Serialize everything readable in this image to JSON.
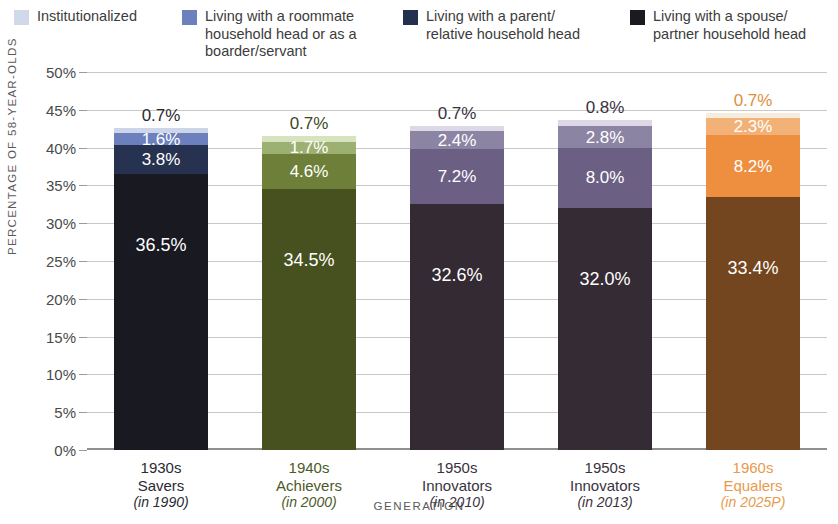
{
  "legend": {
    "items": [
      {
        "label": "Institutionalized",
        "color": "#cfd9ea",
        "name": "legend-institutionalized"
      },
      {
        "label": "Living with a roommate\nhousehold head or as a\nboarder/servant",
        "color": "#6b80bd",
        "name": "legend-roommate"
      },
      {
        "label": "Living with a parent/\nrelative household head",
        "color": "#23304f",
        "name": "legend-parent"
      },
      {
        "label": "Living with a spouse/\npartner household head",
        "color": "#1a1a20",
        "name": "legend-spouse"
      }
    ]
  },
  "chart_data": {
    "type": "bar",
    "title": "",
    "subtitle": "",
    "xlabel": "GENERATION",
    "ylabel": "PERCENTAGE OF 58-YEAR-OLDS",
    "ylim": [
      0,
      50
    ],
    "ytick_labels": [
      "0%",
      "5%",
      "10%",
      "15%",
      "20%",
      "25%",
      "30%",
      "35%",
      "40%",
      "45%",
      "50%"
    ],
    "ytick_values": [
      0,
      5,
      10,
      15,
      20,
      25,
      30,
      35,
      40,
      45,
      50
    ],
    "grid": true,
    "stacked": true,
    "legend_position": "top",
    "categories": [
      "1930s\nSavers\n(in 1990)",
      "1940s\nAchievers\n(in 2000)",
      "1950s\nInnovators\n(in 2010)",
      "1950s\nInnovators\n(in 2013)",
      "1960s\nEqualers\n(in 2025P)"
    ],
    "series": [
      {
        "name": "Living with a spouse/partner household head",
        "values": [
          36.5,
          34.5,
          32.6,
          32.0,
          33.4
        ]
      },
      {
        "name": "Living with a parent/relative household head",
        "values": [
          3.8,
          4.6,
          7.2,
          8.0,
          8.2
        ]
      },
      {
        "name": "Living with a roommate household head or as a boarder/servant",
        "values": [
          1.6,
          1.7,
          2.4,
          2.8,
          2.3
        ]
      },
      {
        "name": "Institutionalized",
        "values": [
          0.7,
          0.7,
          0.7,
          0.8,
          0.7
        ]
      }
    ],
    "bars": [
      {
        "category_line1": "1930s",
        "category_line2": "Savers",
        "category_line3": "(in 1990)",
        "label_color": "#2a2a33",
        "segments": [
          {
            "series": "Institutionalized",
            "value": 0.7,
            "label": "0.7%",
            "color": "#ccd6e8",
            "label_color": "#2a2a33",
            "label_outside": true
          },
          {
            "series": "Living with a roommate household head or as a boarder/servant",
            "value": 1.6,
            "label": "1.6%",
            "color": "#6b80bd",
            "label_color": "#ffffff",
            "label_outside": false
          },
          {
            "series": "Living with a parent/relative household head",
            "value": 3.8,
            "label": "3.8%",
            "color": "#26324f",
            "label_color": "#ffffff",
            "label_outside": false
          },
          {
            "series": "Living with a spouse/partner household head",
            "value": 36.5,
            "label": "36.5%",
            "color": "#191922",
            "label_color": "#ffffff",
            "label_outside": false
          }
        ]
      },
      {
        "category_line1": "1940s",
        "category_line2": "Achievers",
        "category_line3": "(in 2000)",
        "label_color": "#4c5a28",
        "segments": [
          {
            "series": "Institutionalized",
            "value": 0.7,
            "label": "0.7%",
            "color": "#d7e2bf",
            "label_color": "#3e4a22",
            "label_outside": true
          },
          {
            "series": "Living with a roommate household head or as a boarder/servant",
            "value": 1.7,
            "label": "1.7%",
            "color": "#9cb071",
            "label_color": "#ffffff",
            "label_outside": false
          },
          {
            "series": "Living with a parent/relative household head",
            "value": 4.6,
            "label": "4.6%",
            "color": "#6d7f39",
            "label_color": "#ffffff",
            "label_outside": false
          },
          {
            "series": "Living with a spouse/partner household head",
            "value": 34.5,
            "label": "34.5%",
            "color": "#47511f",
            "label_color": "#ffffff",
            "label_outside": false
          }
        ]
      },
      {
        "category_line1": "1950s",
        "category_line2": "Innovators",
        "category_line3": "(in 2010)",
        "label_color": "#3a3240",
        "segments": [
          {
            "series": "Institutionalized",
            "value": 0.7,
            "label": "0.7%",
            "color": "#ded8e6",
            "label_color": "#3a3240",
            "label_outside": true
          },
          {
            "series": "Living with a roommate household head or as a boarder/servant",
            "value": 2.4,
            "label": "2.4%",
            "color": "#8c84a3",
            "label_color": "#ffffff",
            "label_outside": false
          },
          {
            "series": "Living with a parent/relative household head",
            "value": 7.2,
            "label": "7.2%",
            "color": "#6b5f84",
            "label_color": "#ffffff",
            "label_outside": false
          },
          {
            "series": "Living with a spouse/partner household head",
            "value": 32.6,
            "label": "32.6%",
            "color": "#342a33",
            "label_color": "#ffffff",
            "label_outside": false
          }
        ]
      },
      {
        "category_line1": "1950s",
        "category_line2": "Innovators",
        "category_line3": "(in 2013)",
        "label_color": "#3a3240",
        "segments": [
          {
            "series": "Institutionalized",
            "value": 0.8,
            "label": "0.8%",
            "color": "#ded8e6",
            "label_color": "#3a3240",
            "label_outside": true
          },
          {
            "series": "Living with a roommate household head or as a boarder/servant",
            "value": 2.8,
            "label": "2.8%",
            "color": "#8c84a3",
            "label_color": "#ffffff",
            "label_outside": false
          },
          {
            "series": "Living with a parent/relative household head",
            "value": 8.0,
            "label": "8.0%",
            "color": "#6b5f84",
            "label_color": "#ffffff",
            "label_outside": false
          },
          {
            "series": "Living with a spouse/partner household head",
            "value": 32.0,
            "label": "32.0%",
            "color": "#352b34",
            "label_color": "#ffffff",
            "label_outside": false
          }
        ]
      },
      {
        "category_line1": "1960s",
        "category_line2": "Equalers",
        "category_line3": "(in 2025P)",
        "label_color": "#e89a4e",
        "segments": [
          {
            "series": "Institutionalized",
            "value": 0.7,
            "label": "0.7%",
            "color": "#f7ecdd",
            "label_color": "#dd8f3f",
            "label_outside": true
          },
          {
            "series": "Living with a roommate household head or as a boarder/servant",
            "value": 2.3,
            "label": "2.3%",
            "color": "#f2b277",
            "label_color": "#ffffff",
            "label_outside": false
          },
          {
            "series": "Living with a parent/relative household head",
            "value": 8.2,
            "label": "8.2%",
            "color": "#ee8f3f",
            "label_color": "#ffffff",
            "label_outside": false
          },
          {
            "series": "Living with a spouse/partner household head",
            "value": 33.4,
            "label": "33.4%",
            "color": "#73461f",
            "label_color": "#ffffff",
            "label_outside": false
          }
        ]
      }
    ]
  }
}
